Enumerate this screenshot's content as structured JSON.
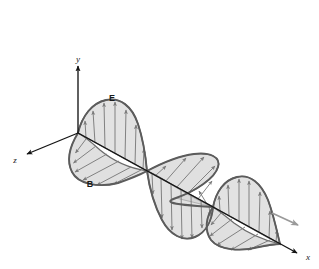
{
  "figure": {
    "kind": "electromagnetic-plane-wave-diagram",
    "background_color": "#ffffff",
    "width": 319,
    "height": 269
  },
  "axes": {
    "origin": {
      "x": 78,
      "y": 133
    },
    "color": "#141414",
    "items": [
      {
        "id": "y",
        "label": "y",
        "from": {
          "x": 78,
          "y": 133
        },
        "to": {
          "x": 78,
          "y": 66
        },
        "label_pos": {
          "x": 78,
          "y": 62
        },
        "arrow": "up"
      },
      {
        "id": "z",
        "label": "z",
        "from": {
          "x": 78,
          "y": 133
        },
        "to": {
          "x": 26,
          "y": 155
        },
        "label_pos": {
          "x": 15,
          "y": 163
        },
        "arrow": "down-left"
      },
      {
        "id": "x",
        "label": "x",
        "from": {
          "x": 78,
          "y": 133
        },
        "to": {
          "x": 298,
          "y": 254
        },
        "label_pos": {
          "x": 308,
          "y": 260
        },
        "arrow": "down-right"
      }
    ]
  },
  "fields": {
    "electric": {
      "label": "E",
      "label_pos": {
        "x": 112,
        "y": 101
      },
      "description": "Electric field component oscillating in the vertical (y) plane",
      "fill_color": "#d4d4d4",
      "stroke_color": "#6b6b6b",
      "arrow_color": "#7b7b7b",
      "lobes": [
        {
          "direction": "up",
          "peak": {
            "x": 113,
            "y": 107
          },
          "amplitude": 47
        },
        {
          "direction": "down",
          "peak": {
            "x": 181,
            "y": 234
          },
          "amplitude": 47
        },
        {
          "direction": "up",
          "peak": {
            "x": 248,
            "y": 189
          },
          "amplitude": 40
        }
      ]
    },
    "magnetic": {
      "label": "B",
      "label_pos": {
        "x": 90,
        "y": 187
      },
      "description": "Magnetic field component oscillating in the horizontal (z) plane, perpendicular to E",
      "fill_color": "#d4d4d4",
      "stroke_color": "#6b6b6b",
      "arrow_color": "#7b7b7b",
      "lobes": [
        {
          "direction": "toward-z",
          "peak": {
            "x": 88,
            "y": 178
          },
          "amplitude": 42
        },
        {
          "direction": "away-z",
          "peak": {
            "x": 190,
            "y": 177
          },
          "amplitude": 42
        },
        {
          "direction": "toward-z",
          "peak": {
            "x": 240,
            "y": 237
          },
          "amplitude": 36
        }
      ]
    }
  },
  "propagation": {
    "arrow_label": "",
    "description": "Direction of wave propagation along +x",
    "color": "#9a9a9a",
    "from": {
      "x": 272,
      "y": 213
    },
    "to": {
      "x": 300,
      "y": 226
    }
  },
  "axis_node_points": [
    {
      "x": 78,
      "y": 133
    },
    {
      "x": 147,
      "y": 171
    },
    {
      "x": 213,
      "y": 207
    },
    {
      "x": 280,
      "y": 244
    }
  ]
}
